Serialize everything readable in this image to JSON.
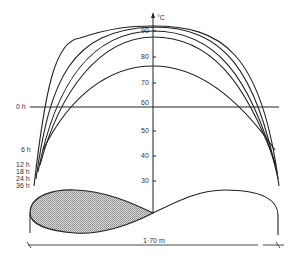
{
  "diagram": {
    "y_axis": {
      "unit": "°C",
      "ticks": [
        "90",
        "80",
        "70",
        "60",
        "50",
        "40",
        "30"
      ]
    },
    "curve_labels": [
      "0 h",
      "6 h",
      "12 h",
      "18 h",
      "24 h",
      "36 h"
    ],
    "dimension": "1·70 m",
    "colors": {
      "line": "#222222",
      "fill": "#b8b8b8"
    }
  }
}
